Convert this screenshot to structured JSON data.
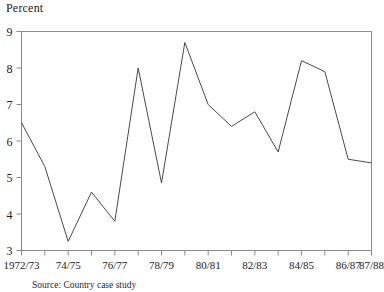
{
  "chart_data": {
    "type": "line",
    "title": "Percent",
    "xlabel": "",
    "ylabel": "",
    "ylim": [
      3,
      9
    ],
    "yticks": [
      3,
      4,
      5,
      6,
      7,
      8,
      9
    ],
    "grid": false,
    "legend": null,
    "x": [
      "1972/73",
      "73/74",
      "74/75",
      "75/76",
      "76/77",
      "77/78",
      "78/79",
      "79/80",
      "80/81",
      "81/82",
      "82/83",
      "83/84",
      "84/85",
      "85/86",
      "86/87",
      "87/88"
    ],
    "xtick_labels": [
      "1972/73",
      "74/75",
      "76/77",
      "78/79",
      "80/81",
      "82/83",
      "84/85",
      "86/87",
      "87/88"
    ],
    "values": [
      6.5,
      5.3,
      3.25,
      4.6,
      3.8,
      8.0,
      4.85,
      8.7,
      7.0,
      6.4,
      6.8,
      5.7,
      8.2,
      7.9,
      5.5,
      5.4
    ],
    "line_color": "#4a4a4a"
  },
  "source": {
    "text": "Source: Country case study"
  }
}
